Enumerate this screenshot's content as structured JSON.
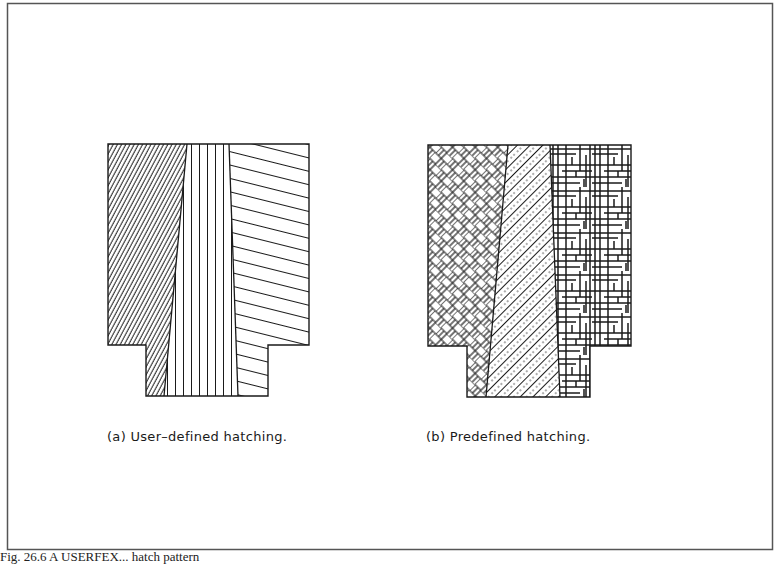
{
  "figure": {
    "caption": "Fig. 26.6 A USERFEX... hatch pattern",
    "panels": [
      {
        "id": "a",
        "label": "(a)  User–defined  hatching.",
        "regions": [
          {
            "name": "left-region",
            "pattern": "fine-diagonal-lines"
          },
          {
            "name": "middle-region",
            "pattern": "vertical-lines"
          },
          {
            "name": "right-region",
            "pattern": "shallow-descending-lines"
          }
        ]
      },
      {
        "id": "b",
        "label": "(b)  Predefined  hatching.",
        "regions": [
          {
            "name": "left-region",
            "pattern": "herringbone-brick"
          },
          {
            "name": "middle-region",
            "pattern": "dotted-diagonal-lines"
          },
          {
            "name": "right-region",
            "pattern": "irregular-grid"
          }
        ]
      }
    ]
  },
  "colors": {
    "ink": "#1a1a1a",
    "frame": "#555555",
    "background": "#ffffff"
  }
}
